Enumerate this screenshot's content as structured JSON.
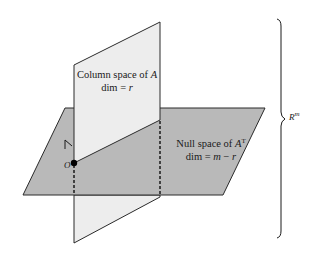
{
  "figure": {
    "column_space": {
      "title": "Column space of ",
      "title_var": "A",
      "dim_prefix": "dim = ",
      "dim_var": "r",
      "fill_color": "#ededed"
    },
    "null_space": {
      "title": "Null space of ",
      "title_var": "A",
      "title_sup": "T",
      "dim_prefix": "dim = ",
      "dim_var": "m",
      "dim_op": " − ",
      "dim_var2": "r",
      "fill_color": "#b9b9b9"
    },
    "origin_label": "O",
    "ambient_space": {
      "label": "R",
      "sup": "m"
    },
    "line_color": "#2a2a2a"
  }
}
